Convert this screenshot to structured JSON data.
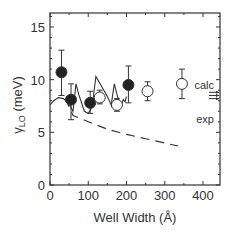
{
  "chart_data": {
    "type": "scatter",
    "title": "",
    "xlabel": "Well Width (Å)",
    "ylabel_symbol": "γ",
    "ylabel_sub": "LO",
    "ylabel_unit": " (meV)",
    "xlim": [
      0,
      440
    ],
    "ylim": [
      0,
      16
    ],
    "xticks": [
      0,
      100,
      200,
      300,
      400
    ],
    "yticks": [
      0,
      5,
      10,
      15
    ],
    "xtick_labels": [
      "0",
      "100",
      "200",
      "300",
      "400"
    ],
    "ytick_labels": [
      "0",
      "5",
      "10",
      "15"
    ],
    "series": [
      {
        "name": "filled",
        "marker": "filled-circle",
        "points": [
          {
            "x": 30,
            "y": 10.7,
            "err_lo": 8.5,
            "err_hi": 12.8
          },
          {
            "x": 55,
            "y": 8.1,
            "err_lo": 6.2,
            "err_hi": 9.6
          },
          {
            "x": 105,
            "y": 7.8,
            "err_lo": 6.8,
            "err_hi": 8.9
          },
          {
            "x": 205,
            "y": 9.5,
            "err_lo": 7.8,
            "err_hi": 11.3
          }
        ]
      },
      {
        "name": "open",
        "marker": "open-circle",
        "points": [
          {
            "x": 130,
            "y": 8.3,
            "err_lo": 7.7,
            "err_hi": 9.0
          },
          {
            "x": 175,
            "y": 7.6,
            "err_lo": 7.0,
            "err_hi": 8.2
          },
          {
            "x": 255,
            "y": 8.9,
            "err_lo": 8.0,
            "err_hi": 9.8
          },
          {
            "x": 345,
            "y": 9.6,
            "err_lo": 8.2,
            "err_hi": 11.0
          }
        ]
      },
      {
        "name": "solid-curve",
        "style": "solid",
        "points": [
          [
            0,
            7.6
          ],
          [
            10,
            8.0
          ],
          [
            22,
            8.3
          ],
          [
            35,
            8.2
          ],
          [
            50,
            7.7
          ],
          [
            60,
            7.0
          ],
          [
            68,
            9.6
          ],
          [
            75,
            8.6
          ],
          [
            90,
            7.0
          ],
          [
            100,
            6.8
          ],
          [
            110,
            7.4
          ],
          [
            120,
            10.3
          ],
          [
            150,
            8.4
          ],
          [
            160,
            7.6
          ],
          [
            168,
            9.6
          ],
          [
            178,
            8.2
          ],
          [
            185,
            7.5
          ],
          [
            192,
            8.1
          ],
          [
            196,
            7.9
          ],
          [
            200,
            8.4
          ]
        ]
      },
      {
        "name": "dashed-line",
        "style": "dashed",
        "points": [
          [
            40,
            8.2
          ],
          [
            60,
            6.6
          ],
          [
            100,
            6.0
          ],
          [
            150,
            5.3
          ],
          [
            200,
            4.8
          ],
          [
            250,
            4.4
          ],
          [
            335,
            3.7
          ]
        ]
      }
    ],
    "annotations": [
      {
        "text": "calc",
        "y": 9.5
      },
      {
        "text": "exp",
        "y": 6.3
      }
    ],
    "arrows_y": [
      8.8,
      8.5,
      8.2
    ],
    "grid": false
  }
}
